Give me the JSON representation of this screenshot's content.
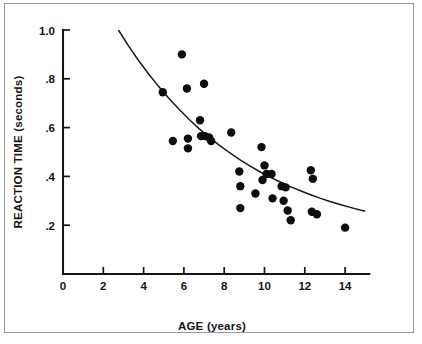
{
  "chart_data": {
    "type": "scatter",
    "title": "",
    "xlabel": "AGE (years)",
    "ylabel": "REACTION TIME (seconds)",
    "xlim": [
      0,
      15.2
    ],
    "ylim": [
      0,
      1.0
    ],
    "grid": false,
    "legend": "none",
    "x_ticks": [
      {
        "value": 0,
        "label": "0"
      },
      {
        "value": 2,
        "label": "2"
      },
      {
        "value": 4,
        "label": "4"
      },
      {
        "value": 6,
        "label": "6"
      },
      {
        "value": 8,
        "label": "8"
      },
      {
        "value": 10,
        "label": "10"
      },
      {
        "value": 12,
        "label": "12"
      },
      {
        "value": 14,
        "label": "14"
      }
    ],
    "y_ticks": [
      {
        "value": 0.2,
        "label": ".2"
      },
      {
        "value": 0.4,
        "label": ".4"
      },
      {
        "value": 0.6,
        "label": ".6"
      },
      {
        "value": 0.8,
        "label": ".8"
      },
      {
        "value": 1.0,
        "label": "1.0"
      }
    ],
    "series": [
      {
        "name": "observations",
        "marker": "filled-circle",
        "color": "#0d0d0d",
        "points": [
          [
            4.95,
            0.745
          ],
          [
            5.45,
            0.545
          ],
          [
            5.9,
            0.9
          ],
          [
            6.15,
            0.76
          ],
          [
            6.2,
            0.555
          ],
          [
            6.2,
            0.515
          ],
          [
            6.8,
            0.63
          ],
          [
            6.85,
            0.565
          ],
          [
            7.0,
            0.78
          ],
          [
            7.05,
            0.565
          ],
          [
            7.25,
            0.56
          ],
          [
            7.35,
            0.545
          ],
          [
            8.35,
            0.58
          ],
          [
            8.75,
            0.42
          ],
          [
            8.8,
            0.36
          ],
          [
            8.8,
            0.27
          ],
          [
            9.55,
            0.33
          ],
          [
            9.85,
            0.52
          ],
          [
            9.9,
            0.385
          ],
          [
            10.0,
            0.445
          ],
          [
            10.1,
            0.41
          ],
          [
            10.35,
            0.41
          ],
          [
            10.4,
            0.31
          ],
          [
            10.85,
            0.36
          ],
          [
            10.95,
            0.3
          ],
          [
            11.05,
            0.355
          ],
          [
            11.15,
            0.26
          ],
          [
            11.3,
            0.22
          ],
          [
            12.3,
            0.425
          ],
          [
            12.35,
            0.255
          ],
          [
            12.4,
            0.39
          ],
          [
            12.6,
            0.245
          ],
          [
            14.0,
            0.19
          ]
        ]
      }
    ],
    "fit_curve": {
      "name": "fitted-exponential-decay",
      "color": "#1a1a1a",
      "x_start": 2.75,
      "x_end": 15.0,
      "points": [
        [
          2.75,
          1.0
        ],
        [
          3.25,
          0.935
        ],
        [
          3.75,
          0.875
        ],
        [
          4.25,
          0.82
        ],
        [
          4.75,
          0.768
        ],
        [
          5.25,
          0.72
        ],
        [
          5.75,
          0.676
        ],
        [
          6.25,
          0.634
        ],
        [
          6.75,
          0.596
        ],
        [
          7.25,
          0.561
        ],
        [
          7.75,
          0.528
        ],
        [
          8.25,
          0.498
        ],
        [
          8.75,
          0.47
        ],
        [
          9.25,
          0.444
        ],
        [
          9.75,
          0.42
        ],
        [
          10.25,
          0.398
        ],
        [
          10.75,
          0.378
        ],
        [
          11.25,
          0.359
        ],
        [
          11.75,
          0.342
        ],
        [
          12.25,
          0.326
        ],
        [
          12.75,
          0.311
        ],
        [
          13.25,
          0.297
        ],
        [
          13.75,
          0.285
        ],
        [
          14.25,
          0.273
        ],
        [
          14.75,
          0.262
        ],
        [
          15.0,
          0.257
        ]
      ]
    }
  }
}
